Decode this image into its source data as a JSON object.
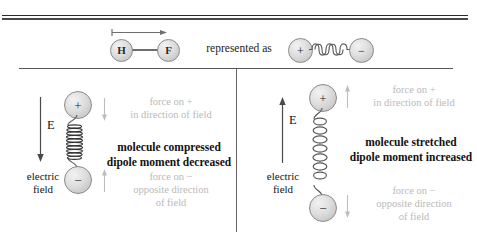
{
  "figure": {
    "top_cut_text": "",
    "header": {
      "molecule": {
        "atom_left_label": "H",
        "atom_right_label": "F",
        "dipole_arrow_name": "dipole-moment-arrow"
      },
      "connector_text": "represented as",
      "model": {
        "charge_positive": "+",
        "charge_negative": "−",
        "spring_name": "bond-spring"
      }
    },
    "panels": [
      {
        "id": "left",
        "field_label": "E",
        "field_caption_line1": "electric",
        "field_caption_line2": "field",
        "field_direction": "down",
        "charge_top": "+",
        "charge_bottom": "−",
        "spring_state": "compressed",
        "force_top_line1": "force on +",
        "force_top_line2": "in direction of field",
        "force_top_direction": "down",
        "force_bottom_line1": "force on −",
        "force_bottom_line2": "opposite direction",
        "force_bottom_line3": "of field",
        "force_bottom_direction": "up",
        "result_line1": "molecule compressed",
        "result_line2": "dipole moment decreased"
      },
      {
        "id": "right",
        "field_label": "E",
        "field_caption_line1": "electric",
        "field_caption_line2": "field",
        "field_direction": "up",
        "charge_top": "+",
        "charge_bottom": "−",
        "spring_state": "stretched",
        "force_top_line1": "force on +",
        "force_top_line2": "in direction of field",
        "force_top_direction": "up",
        "force_bottom_line1": "force on −",
        "force_bottom_line2": "opposite direction",
        "force_bottom_line3": "of field",
        "force_bottom_direction": "down",
        "result_line1": "molecule stretched",
        "result_line2": "dipole moment increased"
      }
    ]
  },
  "colors": {
    "rule": "#2b2b2b",
    "atom_fill": "#dedede",
    "atom_stroke": "#8a8a8a",
    "gray_note": "#b9b9b9",
    "black_text": "#111111",
    "spring_stroke": "#555555"
  }
}
